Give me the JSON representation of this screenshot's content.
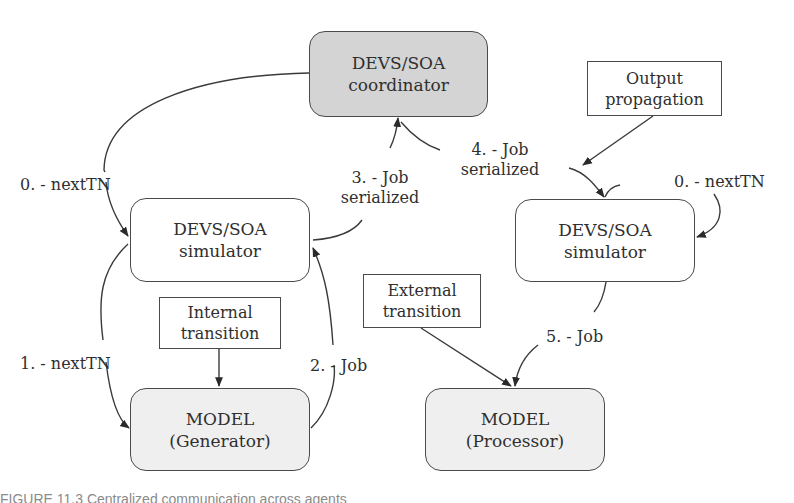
{
  "diagram": {
    "nodes": {
      "coordinator": {
        "line1": "DEVS/SOA",
        "line2": "coordinator",
        "fill": "#d4d4d4"
      },
      "left_simulator": {
        "line1": "DEVS/SOA",
        "line2": "simulator",
        "fill": "#ffffff"
      },
      "right_simulator": {
        "line1": "DEVS/SOA",
        "line2": "simulator",
        "fill": "#ffffff"
      },
      "generator_model": {
        "line1": "MODEL",
        "line2": "(Generator)",
        "fill": "#efefef"
      },
      "processor_model": {
        "line1": "MODEL",
        "line2": "(Processor)",
        "fill": "#efefef"
      },
      "internal_transition": {
        "line1": "Internal",
        "line2": "transition"
      },
      "external_transition": {
        "line1": "External",
        "line2": "transition"
      },
      "output_propagation": {
        "line1": "Output",
        "line2": "propagation"
      }
    },
    "edge_labels": {
      "left_nexttn_0": "0. - nextTN",
      "right_nexttn_0": "0. - nextTN",
      "nexttn_1": "1. - nextTN",
      "job_2": "2. - Job",
      "job_serialized_3_line1": "3. - Job",
      "job_serialized_3_line2": "serialized",
      "job_serialized_4_line1": "4. - Job",
      "job_serialized_4_line2": "serialized",
      "job_5": "5. - Job"
    },
    "edges": [
      {
        "from": "coordinator",
        "to": "left_simulator",
        "label": "0. - nextTN"
      },
      {
        "from": "coordinator",
        "to": "right_simulator",
        "label": "0. - nextTN"
      },
      {
        "from": "left_simulator",
        "to": "generator_model",
        "label": "1. - nextTN"
      },
      {
        "from": "generator_model",
        "to": "left_simulator",
        "label": "2. - Job"
      },
      {
        "from": "left_simulator",
        "to": "coordinator",
        "label": "3. - Job serialized"
      },
      {
        "from": "coordinator",
        "to": "right_simulator",
        "label": "4. - Job serialized"
      },
      {
        "from": "right_simulator",
        "to": "processor_model",
        "label": "5. - Job"
      },
      {
        "from": "internal_transition",
        "to": "generator_model",
        "label": ""
      },
      {
        "from": "external_transition",
        "to": "processor_model",
        "label": ""
      },
      {
        "from": "output_propagation",
        "to": "right_simulator",
        "label": ""
      }
    ]
  },
  "caption": "FIGURE 11.3   Centralized communication across agents"
}
